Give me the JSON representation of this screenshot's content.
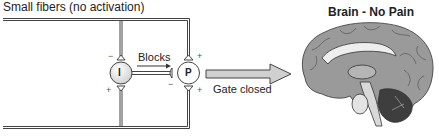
{
  "diagram": {
    "title": "Small fibers (no activation)",
    "brain_title": "Brain - No Pain",
    "inhibition_label": "Blocks",
    "arrow_label": "Gate closed",
    "neurons": [
      {
        "id": "I",
        "label": "I",
        "role": "inhibitory interneuron"
      },
      {
        "id": "P",
        "label": "P",
        "role": "projection neuron"
      }
    ],
    "synapse_signs": {
      "i_top": "−",
      "i_bottom": "+",
      "p_top": "+",
      "p_bottom": "+",
      "p_left": "−"
    },
    "colors": {
      "line": "#444444",
      "neuron_fill": "#e6e6e6",
      "arrow_fill": "#cccccc",
      "brain_fill": "#9a9a9a",
      "brain_dark": "#555555"
    }
  }
}
